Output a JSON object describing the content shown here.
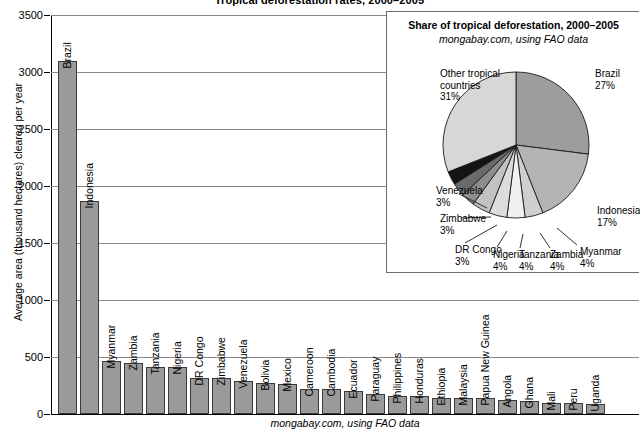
{
  "title": "Tropical deforestation rates, 2000–2005",
  "credit": "mongabay.com, using FAO data",
  "axis": {
    "ylabel": "Average area (thousand hectares) cleared per year",
    "yticks": [
      "3500",
      "3000",
      "2500",
      "2000",
      "1500",
      "1000",
      "500",
      "0"
    ]
  },
  "inset": {
    "title": "Share of tropical deforestation, 2000–2005",
    "subtitle": "mongabay.com, using FAO data"
  },
  "chart_data": [
    {
      "type": "bar",
      "title": "Tropical deforestation rates, 2000–2005",
      "xlabel": "",
      "ylabel": "Average area (thousand hectares) cleared per year",
      "ylim": [
        0,
        3500
      ],
      "ytick_step": 500,
      "grid": true,
      "categories": [
        "Brazil",
        "Indonesia",
        "Myanmar",
        "Zambia",
        "Tanzania",
        "Nigeria",
        "DR Congo",
        "Zimbabwe",
        "Venezuela",
        "Bolivia",
        "Mexico",
        "Cameroon",
        "Cambodia",
        "Ecuador",
        "Paraguay",
        "Philippines",
        "Honduras",
        "Ethiopia",
        "Malaysia",
        "Papua New Guinea",
        "Angola",
        "Ghana",
        "Mali",
        "Peru",
        "Uganda"
      ],
      "values": [
        3100,
        1870,
        466,
        445,
        412,
        410,
        319,
        313,
        288,
        270,
        260,
        220,
        219,
        198,
        179,
        157,
        156,
        141,
        140,
        139,
        125,
        115,
        100,
        94,
        86
      ],
      "bar_color": "#9a9a9a",
      "bar_edge_color": "#3a3a3a"
    },
    {
      "type": "pie",
      "title": "Share of tropical deforestation, 2000–2005",
      "subtitle": "mongabay.com, using FAO data",
      "labels": [
        "Brazil",
        "Indonesia",
        "Myanmar",
        "Zambia",
        "Tanzania",
        "Nigeria",
        "DR Congo",
        "Zimbabwe",
        "Venezuela",
        "Other tropical countries"
      ],
      "values": [
        27,
        17,
        4,
        4,
        4,
        4,
        3,
        3,
        3,
        31
      ],
      "unit": "%",
      "legend_position": "callout-labels",
      "slice_labels": [
        {
          "name": "Brazil",
          "pct": "27%"
        },
        {
          "name": "Indonesia",
          "pct": "17%"
        },
        {
          "name": "Myanmar",
          "pct": "4%"
        },
        {
          "name": "Zambia",
          "pct": "4%"
        },
        {
          "name": "Tanzania",
          "pct": "4%"
        },
        {
          "name": "Nigeria",
          "pct": "4%"
        },
        {
          "name": "DR Congo",
          "pct": "3%"
        },
        {
          "name": "Zimbabwe",
          "pct": "3%"
        },
        {
          "name": "Venezuela",
          "pct": "3%"
        },
        {
          "name": "Other tropical countries",
          "pct": "31%"
        }
      ]
    }
  ]
}
